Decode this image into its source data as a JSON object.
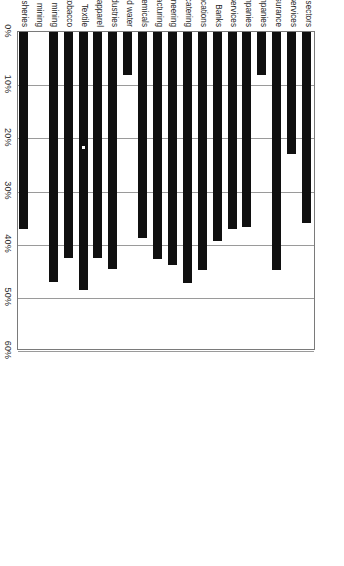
{
  "chart_data": {
    "type": "bar",
    "title": "",
    "subtitle": "",
    "xlabel": "",
    "ylabel": "",
    "orientation": "vertical-rotated",
    "grid": true,
    "legend": false,
    "legend_position": "none",
    "ylim": [
      0,
      60
    ],
    "value_unit": "%",
    "tick_labels": [
      "0%",
      "10%",
      "20%",
      "30%",
      "40%",
      "50%",
      "60%"
    ],
    "tick_values": [
      0,
      10,
      20,
      30,
      40,
      50,
      60
    ],
    "bar_color": "#101010",
    "categories": [
      "All sectors",
      "Other services",
      "Insurance",
      "Investment companies",
      "Holding companies",
      "Other financial services",
      "Banks",
      "Transportation and communcations",
      "Retailing—hotels, restaurants, catering",
      "Building and civil engineering",
      "Metals manufacturing",
      "Chemicals",
      "Electricity and water",
      "Other manufacturing industries",
      "Leather, footwear, apparel",
      "Textile",
      "Food, beverages, tobacco",
      "Nonenergy-related mineral mining",
      "Energy-related mineral mining",
      "Agriculture, forestry, fisheries"
    ],
    "values": [
      36.0,
      23.0,
      44.8,
      8.0,
      36.7,
      37.0,
      39.3,
      44.8,
      47.2,
      43.8,
      42.7,
      38.7,
      8.0,
      44.5,
      42.6,
      48.6,
      42.5,
      47.0,
      0.0,
      37.0
    ]
  }
}
